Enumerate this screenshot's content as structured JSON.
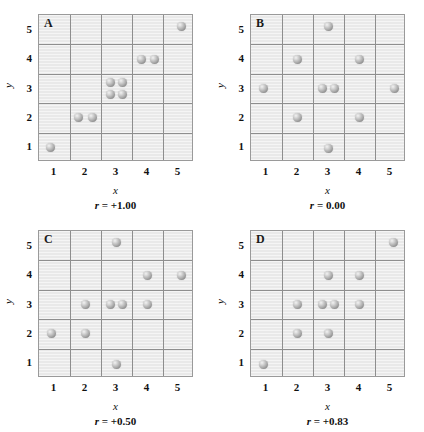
{
  "figure": {
    "axis_x_label": "x",
    "axis_y_label": "y",
    "x_ticks": [
      "1",
      "2",
      "3",
      "4",
      "5"
    ],
    "y_ticks": [
      "1",
      "2",
      "3",
      "4",
      "5"
    ],
    "marker_color": "#a9a9a9",
    "grid_color": "#8e8e8e",
    "plot_background": "#e9e9e9"
  },
  "chart_data": [
    {
      "type": "scatter",
      "panel": "A",
      "title": "A",
      "caption": "r = +1.00",
      "r_symbol": "r",
      "r_value": "= +1.00",
      "correlation": 1.0,
      "xlabel": "x",
      "ylabel": "y",
      "xlim": [
        0.5,
        5.5
      ],
      "ylim": [
        0.5,
        5.5
      ],
      "grid": true,
      "x": [
        1,
        2,
        2,
        3,
        3,
        3,
        3,
        4,
        4,
        5
      ],
      "y": [
        1,
        2,
        2,
        3,
        3,
        3,
        3,
        4,
        4,
        5
      ],
      "points": [
        {
          "x": 1,
          "y": 1,
          "dx": -0.12,
          "dy": 0.0
        },
        {
          "x": 2,
          "y": 2,
          "dx": -0.22,
          "dy": 0.0
        },
        {
          "x": 2,
          "y": 2,
          "dx": 0.22,
          "dy": 0.0
        },
        {
          "x": 3,
          "y": 3,
          "dx": -0.18,
          "dy": 0.2
        },
        {
          "x": 3,
          "y": 3,
          "dx": 0.2,
          "dy": 0.2
        },
        {
          "x": 3,
          "y": 3,
          "dx": -0.18,
          "dy": -0.22
        },
        {
          "x": 3,
          "y": 3,
          "dx": 0.2,
          "dy": -0.22
        },
        {
          "x": 4,
          "y": 4,
          "dx": -0.2,
          "dy": 0.0
        },
        {
          "x": 4,
          "y": 4,
          "dx": 0.22,
          "dy": 0.0
        },
        {
          "x": 5,
          "y": 5,
          "dx": 0.1,
          "dy": 0.12
        }
      ]
    },
    {
      "type": "scatter",
      "panel": "B",
      "title": "B",
      "caption": "r = 0.00",
      "r_symbol": "r",
      "r_value": "= 0.00",
      "correlation": 0.0,
      "xlabel": "x",
      "ylabel": "y",
      "xlim": [
        0.5,
        5.5
      ],
      "ylim": [
        0.5,
        5.5
      ],
      "grid": true,
      "x": [
        3,
        2,
        4,
        1,
        3,
        3,
        5,
        2,
        4,
        3
      ],
      "y": [
        5,
        4,
        4,
        3,
        3,
        3,
        3,
        2,
        2,
        1
      ],
      "points": [
        {
          "x": 3,
          "y": 5,
          "dx": 0.0,
          "dy": 0.1
        },
        {
          "x": 2,
          "y": 4,
          "dx": 0.0,
          "dy": 0.0
        },
        {
          "x": 4,
          "y": 4,
          "dx": 0.0,
          "dy": 0.0
        },
        {
          "x": 1,
          "y": 3,
          "dx": -0.1,
          "dy": 0.0
        },
        {
          "x": 3,
          "y": 3,
          "dx": -0.2,
          "dy": 0.0
        },
        {
          "x": 3,
          "y": 3,
          "dx": 0.18,
          "dy": 0.0
        },
        {
          "x": 5,
          "y": 3,
          "dx": 0.12,
          "dy": 0.0
        },
        {
          "x": 2,
          "y": 2,
          "dx": 0.0,
          "dy": 0.0
        },
        {
          "x": 4,
          "y": 2,
          "dx": 0.0,
          "dy": 0.0
        },
        {
          "x": 3,
          "y": 1,
          "dx": 0.0,
          "dy": -0.05
        }
      ]
    },
    {
      "type": "scatter",
      "panel": "C",
      "title": "C",
      "caption": "r = +0.50",
      "r_symbol": "r",
      "r_value": "= +0.50",
      "correlation": 0.5,
      "xlabel": "x",
      "ylabel": "y",
      "xlim": [
        0.5,
        5.5
      ],
      "ylim": [
        0.5,
        5.5
      ],
      "grid": true,
      "x": [
        3,
        4,
        5,
        2,
        3,
        3,
        4,
        1,
        2,
        3
      ],
      "y": [
        5,
        4,
        4,
        3,
        3,
        3,
        3,
        2,
        2,
        1
      ],
      "points": [
        {
          "x": 3,
          "y": 5,
          "dx": 0.0,
          "dy": 0.1
        },
        {
          "x": 4,
          "y": 4,
          "dx": 0.0,
          "dy": 0.0
        },
        {
          "x": 5,
          "y": 4,
          "dx": 0.1,
          "dy": 0.0
        },
        {
          "x": 2,
          "y": 3,
          "dx": 0.0,
          "dy": 0.0
        },
        {
          "x": 3,
          "y": 3,
          "dx": -0.2,
          "dy": 0.0
        },
        {
          "x": 3,
          "y": 3,
          "dx": 0.18,
          "dy": 0.0
        },
        {
          "x": 4,
          "y": 3,
          "dx": 0.0,
          "dy": 0.0
        },
        {
          "x": 1,
          "y": 2,
          "dx": -0.1,
          "dy": 0.0
        },
        {
          "x": 2,
          "y": 2,
          "dx": 0.0,
          "dy": 0.0
        },
        {
          "x": 3,
          "y": 1,
          "dx": 0.0,
          "dy": -0.05
        }
      ]
    },
    {
      "type": "scatter",
      "panel": "D",
      "title": "D",
      "caption": "r = +0.83",
      "r_symbol": "r",
      "r_value": "= +0.83",
      "correlation": 0.83,
      "xlabel": "x",
      "ylabel": "y",
      "xlim": [
        0.5,
        5.5
      ],
      "ylim": [
        0.5,
        5.5
      ],
      "grid": true,
      "x": [
        5,
        3,
        4,
        2,
        3,
        3,
        4,
        2,
        3,
        1
      ],
      "y": [
        5,
        4,
        4,
        3,
        3,
        3,
        3,
        2,
        2,
        1
      ],
      "points": [
        {
          "x": 5,
          "y": 5,
          "dx": 0.1,
          "dy": 0.1
        },
        {
          "x": 3,
          "y": 4,
          "dx": 0.0,
          "dy": 0.0
        },
        {
          "x": 4,
          "y": 4,
          "dx": 0.0,
          "dy": 0.0
        },
        {
          "x": 2,
          "y": 3,
          "dx": 0.0,
          "dy": 0.0
        },
        {
          "x": 3,
          "y": 3,
          "dx": -0.2,
          "dy": 0.0
        },
        {
          "x": 3,
          "y": 3,
          "dx": 0.18,
          "dy": 0.0
        },
        {
          "x": 4,
          "y": 3,
          "dx": 0.0,
          "dy": 0.0
        },
        {
          "x": 2,
          "y": 2,
          "dx": 0.0,
          "dy": 0.0
        },
        {
          "x": 3,
          "y": 2,
          "dx": 0.0,
          "dy": 0.0
        },
        {
          "x": 1,
          "y": 1,
          "dx": -0.1,
          "dy": -0.05
        }
      ]
    }
  ]
}
